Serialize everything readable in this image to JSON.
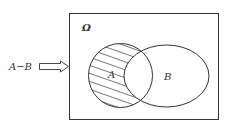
{
  "diagram": {
    "type": "venn",
    "universe_label": "Ω",
    "set_a_label": "A",
    "set_b_label": "B",
    "pointer_label": "A−B",
    "shaded_region": "A minus B",
    "colors": {
      "stroke": "#333333",
      "background": "#ffffff",
      "hatch": "#555555"
    }
  }
}
